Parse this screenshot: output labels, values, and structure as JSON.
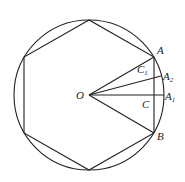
{
  "diagram": {
    "type": "geometry",
    "circle": {
      "center": [
        89,
        95
      ],
      "radius": 75
    },
    "hexagon_vertices": [
      [
        89,
        20
      ],
      [
        24,
        57
      ],
      [
        24,
        133
      ],
      [
        89,
        170
      ],
      [
        154,
        133
      ],
      [
        154,
        57
      ]
    ],
    "points": {
      "O": {
        "label": "O",
        "x": 89,
        "y": 95
      },
      "A": {
        "label": "A",
        "x": 154,
        "y": 57
      },
      "A2": {
        "label": "A",
        "sub": "2",
        "x": 161,
        "y": 76
      },
      "A1": {
        "label": "A",
        "sub": "1",
        "x": 164,
        "y": 95
      },
      "C1": {
        "label": "C",
        "sub": "1",
        "x": 157,
        "y": 67
      },
      "C": {
        "label": "C",
        "x": 154,
        "y": 95
      },
      "B": {
        "label": "B",
        "x": 154,
        "y": 133
      }
    },
    "labels": {
      "O": "O",
      "A": "A",
      "A2_main": "A",
      "A2_sub": "2",
      "A1_main": "A",
      "A1_sub": "1",
      "C1_main": "C",
      "C1_sub": "1",
      "C": "C",
      "B": "B"
    }
  }
}
